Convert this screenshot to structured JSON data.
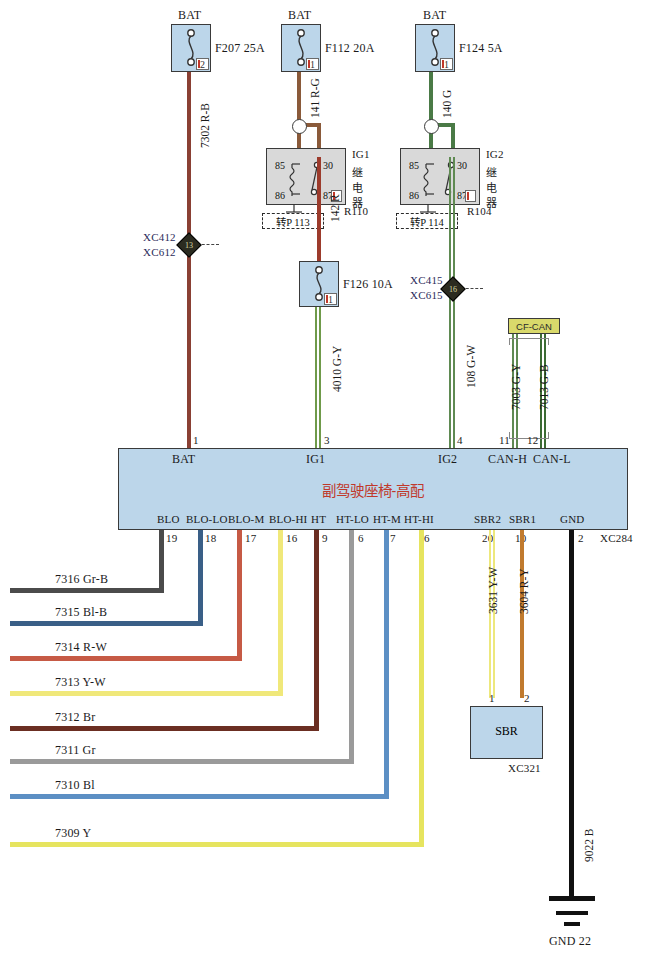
{
  "diagram": {
    "title": "副驾驶座椅-高配",
    "module_connector": "XC284",
    "sbr_connector": "XC321",
    "sbr_label": "SBR",
    "can_label": "CF-CAN",
    "ground_label": "GND 22",
    "ground_wire": "9022 B"
  },
  "fuses": [
    {
      "source": "BAT",
      "name": "F207 25A",
      "pin": "2",
      "wire": "7302 R-B"
    },
    {
      "source": "BAT",
      "name": "F112 20A",
      "pin": "1",
      "wire": "141 R-G"
    },
    {
      "source": "BAT",
      "name": "F124 5A",
      "pin": "1",
      "wire": "140 G"
    },
    {
      "source": "",
      "name": "F126 10A",
      "pin": "1",
      "wire": "4010 G-Y"
    }
  ],
  "relays": [
    {
      "name": "IG1",
      "cn": "继电器",
      "id": "R110",
      "ref": "转P 113",
      "terminals": [
        "85",
        "30",
        "86",
        "87"
      ],
      "out_wire": "142 R"
    },
    {
      "name": "IG2",
      "cn": "继电器",
      "id": "R104",
      "ref": "转P 114",
      "terminals": [
        "85",
        "30",
        "86",
        "87"
      ],
      "out_wire": "108 G-W"
    }
  ],
  "splices": [
    {
      "top": "XC412",
      "bottom": "XC612",
      "num": "13"
    },
    {
      "top": "XC415",
      "bottom": "XC615",
      "num": "16"
    }
  ],
  "can_wires": [
    {
      "wire": "7003 G-Y",
      "pin": "11",
      "signal": "CAN-H"
    },
    {
      "wire": "7013 G-B",
      "pin": "12",
      "signal": "CAN-L"
    }
  ],
  "top_pins": [
    {
      "pin": "1",
      "signal": "BAT"
    },
    {
      "pin": "3",
      "signal": "IG1"
    },
    {
      "pin": "4",
      "signal": "IG2"
    },
    {
      "pin": "11",
      "signal": "CAN-H"
    },
    {
      "pin": "12",
      "signal": "CAN-L"
    }
  ],
  "bottom_pins": [
    {
      "signal": "BLO",
      "pin": "19",
      "wire": "7316 Gr-B",
      "color": "#4b4b4b"
    },
    {
      "signal": "BLO-LO",
      "pin": "18",
      "wire": "7315 Bl-B",
      "color": "#3a5f87"
    },
    {
      "signal": "BLO-M",
      "pin": "17",
      "wire": "7314 R-W",
      "color": "#c65a45"
    },
    {
      "signal": "BLO-HI",
      "pin": "16",
      "wire": "7313 Y-W",
      "color": "#f0e87a"
    },
    {
      "signal": "HT",
      "pin": "9",
      "wire": "7312 Br",
      "color": "#6b2e22"
    },
    {
      "signal": "HT-LO",
      "pin": "6",
      "wire": "7311 Gr",
      "color": "#9a9a9a"
    },
    {
      "signal": "HT-M",
      "pin": "7",
      "wire": "7310 Bl",
      "color": "#5c8fc4"
    },
    {
      "signal": "HT-HI",
      "pin": "6",
      "wire": "7309 Y",
      "color": "#e6e45f"
    }
  ],
  "sbr_pins": [
    {
      "signal": "SBR2",
      "pin": "20",
      "wire": "3631 Y-W",
      "sbr_pin": "1",
      "color": "#ede87c"
    },
    {
      "signal": "SBR1",
      "pin": "10",
      "wire": "3604 R-Y",
      "sbr_pin": "2",
      "color": "#c07a2e"
    }
  ],
  "gnd_pin": {
    "signal": "GND",
    "pin": "2"
  },
  "colors": {
    "module_fill": "#bcd6ea",
    "relay_fill": "#d9d9d9",
    "can_fill": "#d9d96b",
    "title_color": "#c0392b",
    "wire_red_black": "#8a4034",
    "wire_red_green": "#8a5a3a",
    "wire_green": "#4a7a46",
    "wire_green_yellow": "#8aa84a",
    "wire_black": "#111111"
  }
}
